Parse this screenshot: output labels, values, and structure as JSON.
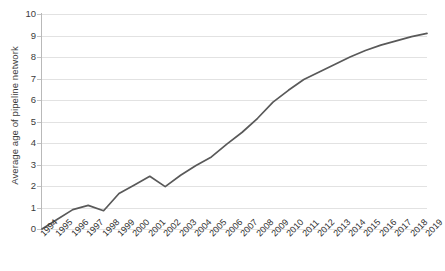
{
  "chart_data": {
    "type": "line",
    "title": "",
    "xlabel": "",
    "ylabel": "Average age of pipeline network",
    "ylim": [
      0,
      10
    ],
    "ytick_labels": [
      "0",
      "1",
      "2",
      "3",
      "4",
      "5",
      "6",
      "7",
      "8",
      "9",
      "10"
    ],
    "yticks": [
      0,
      1,
      2,
      3,
      4,
      5,
      6,
      7,
      8,
      9,
      10
    ],
    "grid": "horizontal",
    "legend": "none",
    "line_color": "#595959",
    "background_color": "#ffffff",
    "gridline_color": "#e2e2e2",
    "categories": [
      "1994",
      "1995",
      "1996",
      "1997",
      "1998",
      "1999",
      "2000",
      "2001",
      "2002",
      "2003",
      "2004",
      "2005",
      "2006",
      "2007",
      "2008",
      "2009",
      "2010",
      "2011",
      "2012",
      "2013",
      "2014",
      "2015",
      "2016",
      "2017",
      "2018",
      "2019"
    ],
    "series": [
      {
        "name": "Average age of pipeline network",
        "values": [
          0.0,
          0.45,
          0.9,
          1.1,
          0.85,
          1.65,
          2.05,
          2.45,
          1.97,
          2.5,
          2.95,
          3.35,
          3.95,
          4.5,
          5.15,
          5.9,
          6.45,
          6.95,
          7.3,
          7.65,
          8.0,
          8.3,
          8.55,
          8.75,
          8.95,
          9.1
        ]
      }
    ]
  }
}
